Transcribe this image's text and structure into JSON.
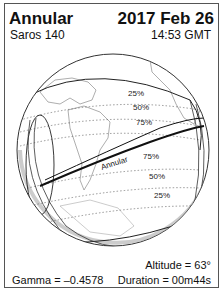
{
  "header": {
    "eclipse_type": "Annular",
    "saros": "Saros 140",
    "date": "2017 Feb 26",
    "time": "14:53 GMT"
  },
  "map": {
    "path_label": "Annular",
    "upper_contours": [
      "25%",
      "50%",
      "75%"
    ],
    "lower_contours": [
      "75%",
      "50%",
      "25%"
    ]
  },
  "footer": {
    "altitude": "Altitude = 63°",
    "gamma": "Gamma = –0.4578",
    "duration": "Duration = 00m44s"
  }
}
